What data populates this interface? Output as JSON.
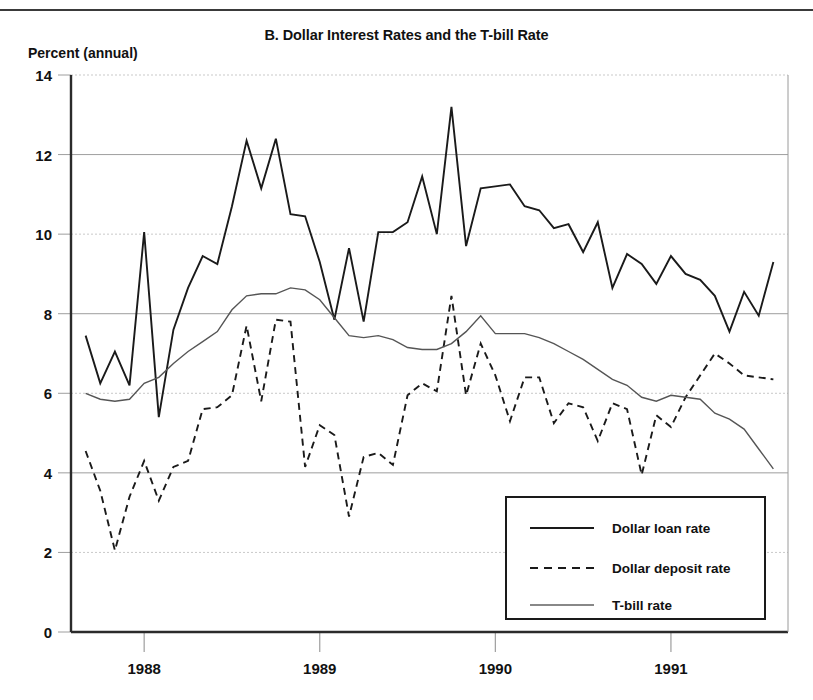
{
  "figure": {
    "title": "B. Dollar Interest Rates and the T-bill Rate",
    "y_axis_label": "Percent (annual)"
  },
  "chart_data": {
    "type": "line",
    "title": "B. Dollar Interest Rates and the T-bill Rate",
    "xlabel": "",
    "ylabel": "Percent (annual)",
    "ylim": [
      0,
      14
    ],
    "xlim": [
      "1987-09",
      "1991-08"
    ],
    "yticks": [
      0,
      2,
      4,
      6,
      8,
      10,
      12,
      14
    ],
    "xticks": [
      "1988",
      "1989",
      "1990",
      "1991"
    ],
    "grid": true,
    "legend_position": "bottom-right",
    "x": [
      "1987-09",
      "1987-10",
      "1987-11",
      "1987-12",
      "1988-01",
      "1988-02",
      "1988-03",
      "1988-04",
      "1988-05",
      "1988-06",
      "1988-07",
      "1988-08",
      "1988-09",
      "1988-10",
      "1988-11",
      "1988-12",
      "1989-01",
      "1989-02",
      "1989-03",
      "1989-04",
      "1989-05",
      "1989-06",
      "1989-07",
      "1989-08",
      "1989-09",
      "1989-10",
      "1989-11",
      "1989-12",
      "1990-01",
      "1990-02",
      "1990-03",
      "1990-04",
      "1990-05",
      "1990-06",
      "1990-07",
      "1990-08",
      "1990-09",
      "1990-10",
      "1990-11",
      "1990-12",
      "1991-01",
      "1991-02",
      "1991-03",
      "1991-04",
      "1991-05",
      "1991-06",
      "1991-07",
      "1991-08"
    ],
    "series": [
      {
        "name": "Dollar loan rate",
        "style": "solid-thick",
        "color": "#1a1a1a",
        "values": [
          7.45,
          6.25,
          7.05,
          6.2,
          10.05,
          5.4,
          7.6,
          8.65,
          9.45,
          9.25,
          10.7,
          12.35,
          11.15,
          12.4,
          10.5,
          10.45,
          9.3,
          7.85,
          9.65,
          7.8,
          10.05,
          10.05,
          10.3,
          11.45,
          10.0,
          13.2,
          9.7,
          11.15,
          11.2,
          11.25,
          10.7,
          10.6,
          10.15,
          10.25,
          9.55,
          10.3,
          8.65,
          9.5,
          9.25,
          8.75,
          9.45,
          9.0,
          8.85,
          8.45,
          7.55,
          8.55,
          7.95,
          9.3
        ]
      },
      {
        "name": "Dollar deposit rate",
        "style": "dashed",
        "color": "#1a1a1a",
        "values": [
          4.55,
          3.55,
          2.05,
          3.4,
          4.3,
          3.3,
          4.15,
          4.3,
          5.6,
          5.65,
          5.95,
          7.7,
          5.8,
          7.85,
          7.8,
          4.15,
          5.2,
          4.95,
          2.9,
          4.4,
          4.5,
          4.2,
          5.95,
          6.25,
          6.05,
          8.45,
          5.95,
          7.25,
          6.45,
          5.3,
          6.4,
          6.4,
          5.25,
          5.75,
          5.65,
          4.8,
          5.75,
          5.6,
          3.95,
          5.45,
          5.15,
          5.9,
          6.45,
          7.0,
          6.75,
          6.45,
          6.4,
          6.35
        ]
      },
      {
        "name": "T-bill rate",
        "style": "solid-thin",
        "color": "#555555",
        "values": [
          6.0,
          5.85,
          5.8,
          5.85,
          6.25,
          6.4,
          6.75,
          7.05,
          7.3,
          7.55,
          8.1,
          8.45,
          8.5,
          8.5,
          8.65,
          8.6,
          8.35,
          7.9,
          7.45,
          7.4,
          7.45,
          7.35,
          7.15,
          7.1,
          7.1,
          7.25,
          7.55,
          7.95,
          7.5,
          7.5,
          7.5,
          7.4,
          7.25,
          7.05,
          6.85,
          6.6,
          6.35,
          6.2,
          5.9,
          5.8,
          5.95,
          5.9,
          5.85,
          5.5,
          5.35,
          5.1,
          4.6,
          4.1
        ]
      }
    ]
  },
  "axis": {
    "y_ticks": [
      "0",
      "2",
      "4",
      "6",
      "8",
      "10",
      "12",
      "14"
    ],
    "x_ticks": [
      "1988",
      "1989",
      "1990",
      "1991"
    ]
  },
  "legend": {
    "items": [
      {
        "label": "Dollar loan rate",
        "style": "solid-thick"
      },
      {
        "label": "Dollar deposit rate",
        "style": "dashed"
      },
      {
        "label": "T-bill rate",
        "style": "solid-thin"
      }
    ]
  }
}
